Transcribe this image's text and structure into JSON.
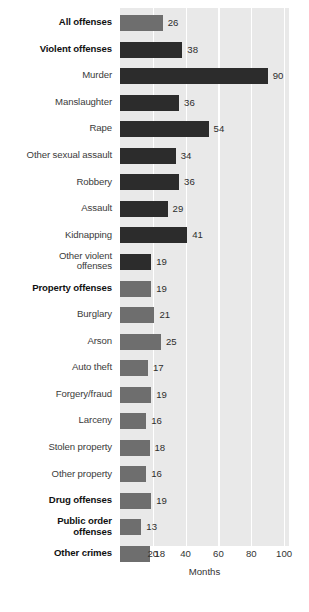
{
  "chart_data": {
    "type": "bar",
    "orientation": "horizontal",
    "title": "",
    "xlabel": "Months",
    "ylabel": "",
    "xlim": [
      0,
      103
    ],
    "xticks": [
      20,
      40,
      60,
      80,
      100
    ],
    "grid": "vertical-white",
    "legend": "none",
    "categories": [
      "All offenses",
      "Violent offenses",
      "Murder",
      "Manslaughter",
      "Rape",
      "Other sexual assault",
      "Robbery",
      "Assault",
      "Kidnapping",
      "Other violent offenses",
      "Property offenses",
      "Burglary",
      "Arson",
      "Auto theft",
      "Forgery/fraud",
      "Larceny",
      "Stolen property",
      "Other property",
      "Drug offenses",
      "Public order offenses",
      "Other crimes"
    ],
    "values": [
      26,
      38,
      90,
      36,
      54,
      34,
      36,
      29,
      41,
      19,
      19,
      21,
      25,
      17,
      19,
      16,
      18,
      16,
      19,
      13,
      18
    ]
  },
  "rows": [
    {
      "label": "All offenses",
      "label2": "",
      "value": 26,
      "bold": true,
      "aggregate": true
    },
    {
      "label": "Violent offenses",
      "label2": "",
      "value": 38,
      "bold": true,
      "aggregate": false
    },
    {
      "label": "Murder",
      "label2": "",
      "value": 90,
      "bold": false,
      "aggregate": false
    },
    {
      "label": "Manslaughter",
      "label2": "",
      "value": 36,
      "bold": false,
      "aggregate": false
    },
    {
      "label": "Rape",
      "label2": "",
      "value": 54,
      "bold": false,
      "aggregate": false
    },
    {
      "label": "Other sexual assault",
      "label2": "",
      "value": 34,
      "bold": false,
      "aggregate": false
    },
    {
      "label": "Robbery",
      "label2": "",
      "value": 36,
      "bold": false,
      "aggregate": false
    },
    {
      "label": "Assault",
      "label2": "",
      "value": 29,
      "bold": false,
      "aggregate": false
    },
    {
      "label": "Kidnapping",
      "label2": "",
      "value": 41,
      "bold": false,
      "aggregate": false
    },
    {
      "label": "Other violent",
      "label2": "offenses",
      "value": 19,
      "bold": false,
      "aggregate": false
    },
    {
      "label": "Property offenses",
      "label2": "",
      "value": 19,
      "bold": true,
      "aggregate": true
    },
    {
      "label": "Burglary",
      "label2": "",
      "value": 21,
      "bold": false,
      "aggregate": true
    },
    {
      "label": "Arson",
      "label2": "",
      "value": 25,
      "bold": false,
      "aggregate": true
    },
    {
      "label": "Auto theft",
      "label2": "",
      "value": 17,
      "bold": false,
      "aggregate": true
    },
    {
      "label": "Forgery/fraud",
      "label2": "",
      "value": 19,
      "bold": false,
      "aggregate": true
    },
    {
      "label": "Larceny",
      "label2": "",
      "value": 16,
      "bold": false,
      "aggregate": true
    },
    {
      "label": "Stolen property",
      "label2": "",
      "value": 18,
      "bold": false,
      "aggregate": true
    },
    {
      "label": "Other property",
      "label2": "",
      "value": 16,
      "bold": false,
      "aggregate": true
    },
    {
      "label": "Drug offenses",
      "label2": "",
      "value": 19,
      "bold": true,
      "aggregate": true
    },
    {
      "label": "Public order",
      "label2": "offenses",
      "value": 13,
      "bold": true,
      "aggregate": true
    },
    {
      "label": "Other crimes",
      "label2": "",
      "value": 18,
      "bold": true,
      "aggregate": true
    }
  ],
  "axis": {
    "ticks": [
      "20",
      "40",
      "60",
      "80",
      "100"
    ],
    "tick_values": [
      20,
      40,
      60,
      80,
      100
    ],
    "title": "Months"
  },
  "colors": {
    "plot_background": "#e9e9e9",
    "gridline": "#ffffff",
    "bar_dark": "#2c2c2c",
    "bar_light": "#6e6e6e",
    "label_text": "#3b3b3b",
    "bold_label_text": "#111111"
  }
}
